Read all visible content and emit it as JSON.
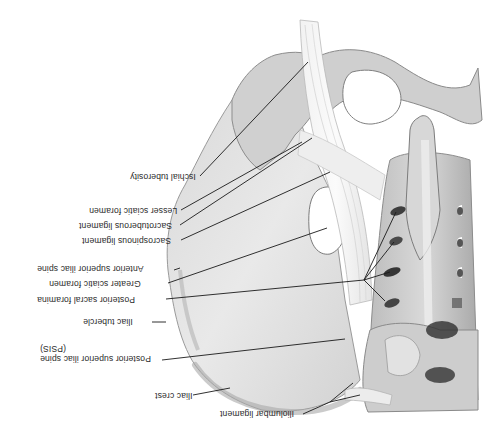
{
  "figure": {
    "orientation": "rotated-180",
    "background": "#ffffff",
    "line_color": "#1a1a1a",
    "bone_colors": {
      "light": "#ededed",
      "mid": "#c9c9c9",
      "dark": "#8a8a8a",
      "shadow": "#4a4a4a"
    }
  },
  "labels": [
    {
      "id": "ischial-tuberosity",
      "text": "Ischial tuberosity"
    },
    {
      "id": "lesser-sciatic-foramen",
      "text": "Lesser sciatic foramen"
    },
    {
      "id": "sacrotuberous-ligament",
      "text": "Sacrotuberous ligament"
    },
    {
      "id": "sacrospinous-ligament",
      "text": "Sacrospinous ligament"
    },
    {
      "id": "anterior-superior-iliac-spine",
      "text": "Anterior superior iliac spine"
    },
    {
      "id": "greater-sciatic-foramen",
      "text": "Greater sciatic foramen"
    },
    {
      "id": "posterior-sacral-foramina",
      "text": "Posterior sacral foramina"
    },
    {
      "id": "iliac-tubercle",
      "text": "Iliac tubercle"
    },
    {
      "id": "psis",
      "text": "Posterior superior iliac spine",
      "text2": "(PSIS)"
    },
    {
      "id": "iliac-crest",
      "text": "Iliac crest"
    },
    {
      "id": "iliolumbar-ligament",
      "text": "Iliolumbar ligament"
    }
  ]
}
